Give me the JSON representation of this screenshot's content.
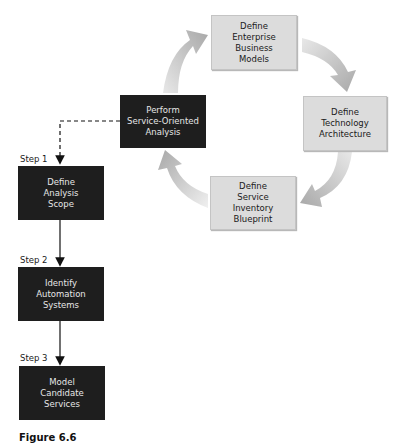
{
  "cycle": {
    "perform": "Perform\nService-Oriented\nAnalysis",
    "enterprise": "Define\nEnterprise\nBusiness\nModels",
    "technology": "Define\nTechnology\nArchitecture",
    "inventory": "Define\nService\nInventory\nBlueprint"
  },
  "steps": [
    {
      "label": "Step 1",
      "box": "Define\nAnalysis\nScope"
    },
    {
      "label": "Step 2",
      "box": "Identify\nAutomation\nSystems"
    },
    {
      "label": "Step 3",
      "box": "Model\nCandidate\nServices"
    }
  ],
  "caption": "Figure 6.6",
  "colors": {
    "dark_box": "#1e1e1e",
    "light_box": "#dcdcdc",
    "cycle_arrow": "#b4b4b4"
  }
}
